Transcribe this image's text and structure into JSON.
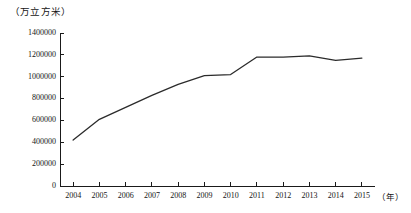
{
  "chart_data": {
    "type": "line",
    "title": "",
    "xlabel": "（年）",
    "ylabel": "（万立方米）",
    "categories": [
      "2004",
      "2005",
      "2006",
      "2007",
      "2008",
      "2009",
      "2010",
      "2011",
      "2012",
      "2013",
      "2014",
      "2015"
    ],
    "values": [
      420000,
      610000,
      720000,
      830000,
      930000,
      1010000,
      1020000,
      1180000,
      1180000,
      1190000,
      1150000,
      1170000
    ],
    "series": [
      {
        "name": "",
        "values": [
          420000,
          610000,
          720000,
          830000,
          930000,
          1010000,
          1020000,
          1180000,
          1180000,
          1190000,
          1150000,
          1170000
        ]
      }
    ],
    "ylim": [
      0,
      1400000
    ],
    "yticks": [
      "0",
      "200000",
      "400000",
      "600000",
      "800000",
      "1000000",
      "1200000",
      "1400000"
    ],
    "ytick_values": [
      0,
      200000,
      400000,
      600000,
      800000,
      1000000,
      1200000,
      1400000
    ],
    "xticks": [
      "2004",
      "2005",
      "2006",
      "2007",
      "2008",
      "2009",
      "2010",
      "2011",
      "2012",
      "2013",
      "2014",
      "2015"
    ],
    "grid": false,
    "legend": "none",
    "line_color": "#2b2b2b",
    "axis_color": "#1a1a1a",
    "background": "#ffffff"
  },
  "labels": {
    "y_unit": "（万立方米）",
    "x_unit": "（年）"
  }
}
